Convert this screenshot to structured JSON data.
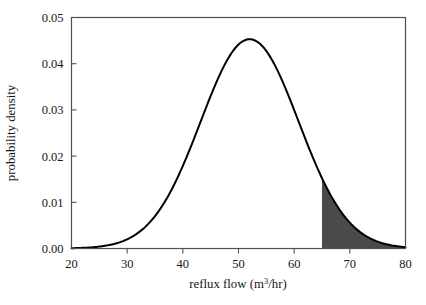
{
  "chart_data": {
    "type": "line",
    "title": "",
    "xlabel": "reflux flow (m³/hr)",
    "xlabel_parts": {
      "before": "reflux flow (m",
      "superscript": "3",
      "after": "/hr)"
    },
    "ylabel": "probability density",
    "xlim": [
      20,
      80
    ],
    "ylim": [
      0,
      0.05
    ],
    "xticks": [
      20,
      30,
      40,
      50,
      60,
      70,
      80
    ],
    "xtick_labels": [
      "20",
      "30",
      "40",
      "50",
      "60",
      "70",
      "80"
    ],
    "yticks": [
      0,
      0.01,
      0.02,
      0.03,
      0.04,
      0.05
    ],
    "ytick_labels": [
      "0.00",
      "0.01",
      "0.02",
      "0.03",
      "0.04",
      "0.05"
    ],
    "grid": false,
    "legend": null,
    "frame": "box",
    "series": [
      {
        "name": "probability density",
        "distribution": "normal",
        "mean": 52.0,
        "std": 8.8,
        "peak_x": 52.0,
        "peak_y": 0.0453,
        "color": "#000000",
        "line_width": 2.0,
        "x": [
          20,
          22,
          24,
          26,
          28,
          30,
          32,
          34,
          36,
          38,
          40,
          42,
          44,
          46,
          48,
          50,
          52,
          54,
          56,
          58,
          60,
          62,
          64,
          65,
          66,
          68,
          70,
          72,
          74,
          76,
          78,
          80
        ],
        "y": [
          0.00014,
          0.00029,
          0.00057,
          0.00106,
          0.00188,
          0.00317,
          0.0051,
          0.00783,
          0.01146,
          0.01601,
          0.02132,
          0.02708,
          0.03281,
          0.03793,
          0.04185,
          0.04414,
          0.04462,
          0.04334,
          0.04055,
          0.03668,
          0.03218,
          0.02751,
          0.02302,
          0.02091,
          0.01893,
          0.01527,
          0.01211,
          0.00945,
          0.00727,
          0.00551,
          0.00412,
          0.00304
        ]
      }
    ],
    "shaded_region": {
      "name": "upper tail",
      "x_start": 65,
      "x_end": 80,
      "fill_color": "#4a4a4a",
      "description": "shaded right tail area under the curve from 65 to 80"
    }
  },
  "axis_titles": {
    "x": "reflux flow (m3/hr)",
    "y": "probability density"
  }
}
